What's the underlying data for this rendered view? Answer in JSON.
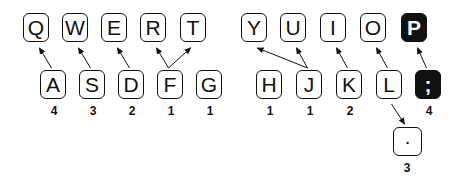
{
  "diagram": {
    "top_row": [
      {
        "label": "Q",
        "x": 23,
        "dark": false
      },
      {
        "label": "W",
        "x": 62,
        "dark": false
      },
      {
        "label": "E",
        "x": 101,
        "dark": false
      },
      {
        "label": "R",
        "x": 140,
        "dark": false
      },
      {
        "label": "T",
        "x": 180,
        "dark": false
      },
      {
        "label": "Y",
        "x": 241,
        "dark": false
      },
      {
        "label": "U",
        "x": 280,
        "dark": false
      },
      {
        "label": "I",
        "x": 320,
        "dark": false
      },
      {
        "label": "O",
        "x": 360,
        "dark": false
      },
      {
        "label": "P",
        "x": 401,
        "dark": true
      }
    ],
    "home_row": [
      {
        "label": "A",
        "x": 40,
        "count": "4",
        "dark": false
      },
      {
        "label": "S",
        "x": 79,
        "count": "3",
        "dark": false
      },
      {
        "label": "D",
        "x": 118,
        "count": "2",
        "dark": false
      },
      {
        "label": "F",
        "x": 157,
        "count": "1",
        "dark": false
      },
      {
        "label": "G",
        "x": 196,
        "count": "1",
        "dark": false
      },
      {
        "label": "H",
        "x": 256,
        "count": "1",
        "dark": false
      },
      {
        "label": "J",
        "x": 296,
        "count": "1",
        "dark": false
      },
      {
        "label": "K",
        "x": 336,
        "count": "2",
        "dark": false
      },
      {
        "label": "L",
        "x": 376,
        "count": "",
        "dark": false
      },
      {
        "label": ";",
        "x": 415,
        "count": "4",
        "dark": true
      }
    ],
    "bottom_row": [
      {
        "label": "·",
        "x": 393,
        "count": "3",
        "dark": false
      }
    ],
    "arrows": [
      {
        "from": "A",
        "to": "Q"
      },
      {
        "from": "S",
        "to": "W"
      },
      {
        "from": "D",
        "to": "E"
      },
      {
        "from": "F",
        "to": "R"
      },
      {
        "from": "F",
        "to": "T"
      },
      {
        "from": "J",
        "to": "Y"
      },
      {
        "from": "J",
        "to": "U"
      },
      {
        "from": "K",
        "to": "I"
      },
      {
        "from": "L",
        "to": "O"
      },
      {
        "from": ";",
        "to": "P"
      },
      {
        "from": "L",
        "to": "·"
      }
    ]
  }
}
